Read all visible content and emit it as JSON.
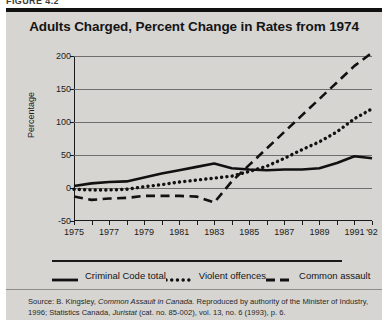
{
  "figure": {
    "number_label": "FIGURE 4.2"
  },
  "chart_data": {
    "type": "line",
    "title": "Adults Charged, Percent Change in Rates from 1974",
    "xlabel": "",
    "ylabel": "Percentage",
    "ylim": [
      -50,
      200
    ],
    "xlim": [
      1975,
      1992
    ],
    "grid": true,
    "legend_position": "bottom",
    "y_ticks": [
      "200",
      "150",
      "100",
      "50",
      "0",
      "-50"
    ],
    "y_tick_values": [
      200,
      150,
      100,
      50,
      0,
      -50
    ],
    "x_tick_labels": [
      "1975",
      "1977",
      "1979",
      "1981",
      "1983",
      "1985",
      "1987",
      "1989",
      "1991",
      "'92"
    ],
    "x_tick_label_years": [
      1975,
      1977,
      1979,
      1981,
      1983,
      1985,
      1987,
      1989,
      1991,
      1992
    ],
    "x": [
      1975,
      1976,
      1977,
      1978,
      1979,
      1980,
      1981,
      1982,
      1983,
      1984,
      1985,
      1986,
      1987,
      1988,
      1989,
      1990,
      1991,
      1992
    ],
    "series": [
      {
        "name": "Criminal Code total",
        "style": "solid",
        "color": "#111111",
        "values": [
          3,
          7,
          9,
          10,
          16,
          22,
          27,
          32,
          37,
          30,
          28,
          27,
          28,
          28,
          30,
          38,
          48,
          45
        ]
      },
      {
        "name": "Violent offences",
        "style": "dotted",
        "color": "#111111",
        "values": [
          -2,
          -3,
          -3,
          -2,
          2,
          5,
          9,
          12,
          15,
          18,
          25,
          33,
          45,
          58,
          70,
          85,
          105,
          120
        ]
      },
      {
        "name": "Common assault",
        "style": "dashed",
        "color": "#111111",
        "values": [
          -13,
          -18,
          -16,
          -15,
          -12,
          -12,
          -12,
          -13,
          -22,
          10,
          35,
          60,
          85,
          110,
          135,
          160,
          185,
          205
        ]
      }
    ]
  },
  "legend": {
    "items": [
      {
        "label": "Criminal Code total",
        "style": "solid"
      },
      {
        "label": "Violent offences",
        "style": "dotted"
      },
      {
        "label": "Common assault",
        "style": "dashed"
      }
    ]
  },
  "source": {
    "line1_prefix": "Source: B. Kingsley, ",
    "line1_italic": "Common Assault in Canada.",
    "line1_suffix": " Reproduced by authority of the Minister of Industry, 1996;",
    "line2_prefix": "Statistics Canada, ",
    "line2_italic": "Juristat",
    "line2_suffix": " (cat. no. 85-002), vol. 13, no. 6 (1993), p. 6."
  }
}
